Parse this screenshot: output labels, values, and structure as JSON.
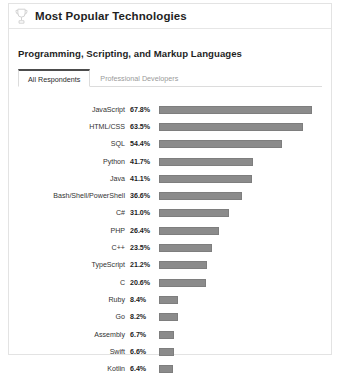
{
  "card": {
    "header": {
      "icon": "trophy-icon",
      "title": "Most Popular Technologies"
    },
    "section_title": "Programming, Scripting, and Markup Languages",
    "tabs": [
      {
        "label": "All Respondents",
        "active": true
      },
      {
        "label": "Professional Developers",
        "active": false
      }
    ]
  },
  "chart_data": {
    "type": "bar",
    "orientation": "horizontal",
    "title": "Programming, Scripting, and Markup Languages",
    "xlabel": "",
    "ylabel": "",
    "xlim": [
      0,
      72
    ],
    "grid": false,
    "legend": false,
    "value_suffix": "%",
    "bar_color": "#8b8b8b",
    "categories": [
      "JavaScript",
      "HTML/CSS",
      "SQL",
      "Python",
      "Java",
      "Bash/Shell/PowerShell",
      "C#",
      "PHP",
      "C++",
      "TypeScript",
      "C",
      "Ruby",
      "Go",
      "Assembly",
      "Swift",
      "Kotlin"
    ],
    "values": [
      67.8,
      63.5,
      54.4,
      41.7,
      41.1,
      36.6,
      31.0,
      26.4,
      23.5,
      21.2,
      20.6,
      8.4,
      8.2,
      6.7,
      6.6,
      6.4
    ],
    "labels": [
      "67.8%",
      "63.5%",
      "54.4%",
      "41.7%",
      "41.1%",
      "36.6%",
      "31.0%",
      "26.4%",
      "23.5%",
      "21.2%",
      "20.6%",
      "8.4%",
      "8.2%",
      "6.7%",
      "6.6%",
      "6.4%"
    ]
  }
}
